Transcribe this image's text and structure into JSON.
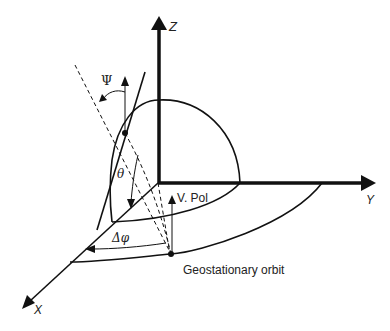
{
  "figure": {
    "type": "3D coordinate diagram of geostationary satellite polarization geometry",
    "colors": {
      "stroke": "#111111",
      "background": "#ffffff",
      "text": "#222222"
    }
  },
  "axes": {
    "z_label": "Z",
    "y_label": "Y",
    "x_label": "X"
  },
  "labels": {
    "psi": "Ψ",
    "theta": "θ",
    "delta_phi": "Δφ",
    "v_pol": "V. Pol",
    "orbit": "Geostationary orbit"
  }
}
